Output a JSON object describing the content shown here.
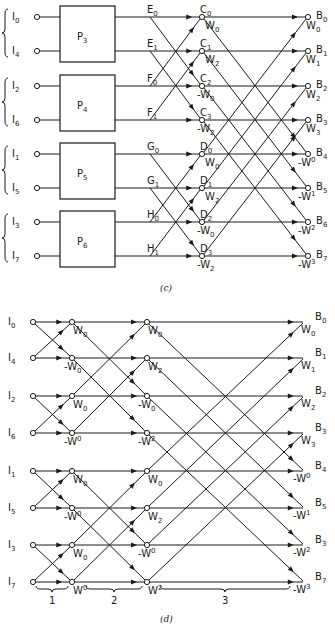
{
  "figure_c": {
    "caption": "(c)",
    "rows_y": [
      17,
      51,
      86,
      120,
      154,
      188,
      222,
      256
    ],
    "inputs": [
      {
        "name": "I",
        "sub": "0"
      },
      {
        "name": "I",
        "sub": "4"
      },
      {
        "name": "I",
        "sub": "2"
      },
      {
        "name": "I",
        "sub": "6"
      },
      {
        "name": "I",
        "sub": "1"
      },
      {
        "name": "I",
        "sub": "5"
      },
      {
        "name": "I",
        "sub": "3"
      },
      {
        "name": "I",
        "sub": "7"
      }
    ],
    "boxes": [
      {
        "name": "P",
        "sub": "3"
      },
      {
        "name": "P",
        "sub": "4"
      },
      {
        "name": "P",
        "sub": "5"
      },
      {
        "name": "P",
        "sub": "6"
      }
    ],
    "mid_labels": [
      {
        "name": "E",
        "sub": "0"
      },
      {
        "name": "E",
        "sub": "1"
      },
      {
        "name": "F",
        "sub": "0"
      },
      {
        "name": "F",
        "sub": "1"
      },
      {
        "name": "G",
        "sub": "0"
      },
      {
        "name": "G",
        "sub": "1"
      },
      {
        "name": "H",
        "sub": "0"
      },
      {
        "name": "H",
        "sub": "1"
      }
    ],
    "stage_nodes": [
      {
        "name": "C",
        "sub": "0",
        "weight": "W",
        "wsub": "0",
        "neg": false
      },
      {
        "name": "C",
        "sub": "1",
        "weight": "W",
        "wsub": "2",
        "neg": false
      },
      {
        "name": "C",
        "sub": "2",
        "weight": "W",
        "wsub": "0",
        "neg": true
      },
      {
        "name": "C",
        "sub": "3",
        "weight": "W",
        "wsub": "2",
        "neg": true
      },
      {
        "name": "D",
        "sub": "0",
        "weight": "W",
        "wsub": "0",
        "neg": false
      },
      {
        "name": "D",
        "sub": "1",
        "weight": "W",
        "wsub": "2",
        "neg": false
      },
      {
        "name": "D",
        "sub": "2",
        "weight": "W",
        "wsub": "0",
        "neg": true
      },
      {
        "name": "D",
        "sub": "3",
        "weight": "W",
        "wsub": "2",
        "neg": true
      }
    ],
    "outputs": [
      {
        "name": "B",
        "sub": "0",
        "weight": "W",
        "wsub": "0",
        "neg": false
      },
      {
        "name": "B",
        "sub": "1",
        "weight": "W",
        "wsub": "1",
        "neg": false
      },
      {
        "name": "B",
        "sub": "2",
        "weight": "W",
        "wsub": "2",
        "neg": false
      },
      {
        "name": "B",
        "sub": "3",
        "weight": "W",
        "wsub": "3",
        "neg": false
      },
      {
        "name": "B",
        "sub": "4",
        "weight": "W",
        "wsub": "0",
        "neg": true
      },
      {
        "name": "B",
        "sub": "5",
        "weight": "W",
        "wsub": "1",
        "neg": true
      },
      {
        "name": "B",
        "sub": "6",
        "weight": "W",
        "wsub": "2",
        "neg": true
      },
      {
        "name": "B",
        "sub": "7",
        "weight": "W",
        "wsub": "3",
        "neg": true
      }
    ]
  },
  "figure_d": {
    "caption": "(d)",
    "rows_y": [
      322,
      358,
      396,
      433,
      471,
      508,
      545,
      582
    ],
    "inputs": [
      {
        "name": "I",
        "sub": "0"
      },
      {
        "name": "I",
        "sub": "4"
      },
      {
        "name": "I",
        "sub": "2"
      },
      {
        "name": "I",
        "sub": "6"
      },
      {
        "name": "I",
        "sub": "1"
      },
      {
        "name": "I",
        "sub": "5"
      },
      {
        "name": "I",
        "sub": "3"
      },
      {
        "name": "I",
        "sub": "7"
      }
    ],
    "stage1_weights": [
      {
        "text": "W",
        "sup": "0",
        "neg": false,
        "style": "sub"
      },
      {
        "text": "W",
        "sup": "0",
        "neg": true,
        "style": "sub"
      },
      {
        "text": "W",
        "sup": "0",
        "neg": false,
        "style": "sub"
      },
      {
        "text": "W",
        "sup": "0",
        "neg": true,
        "style": "sup"
      },
      {
        "text": "W",
        "sup": "0",
        "neg": false,
        "style": "sub"
      },
      {
        "text": "W",
        "sup": "0",
        "neg": true,
        "style": "sup"
      },
      {
        "text": "W",
        "sup": "0",
        "neg": false,
        "style": "sub"
      },
      {
        "text": "W",
        "sup": "0",
        "neg": false,
        "style": "sup"
      }
    ],
    "stage2_weights": [
      {
        "text": "W",
        "sup": "0",
        "neg": false,
        "style": "sub"
      },
      {
        "text": "W",
        "sup": "2",
        "neg": false,
        "style": "sub"
      },
      {
        "text": "W",
        "sup": "0",
        "neg": true,
        "style": "sub"
      },
      {
        "text": "W",
        "sup": "2",
        "neg": true,
        "style": "sup"
      },
      {
        "text": "W",
        "sup": "0",
        "neg": false,
        "style": "sub"
      },
      {
        "text": "W",
        "sup": "2",
        "neg": false,
        "style": "sub"
      },
      {
        "text": "W",
        "sup": "0",
        "neg": true,
        "style": "sup"
      },
      {
        "text": "W",
        "sup": "2",
        "neg": false,
        "style": "sup"
      }
    ],
    "outputs": [
      {
        "name": "B",
        "sub": "0",
        "weight": "W",
        "wsub": "0",
        "neg": false,
        "style": "sub"
      },
      {
        "name": "B",
        "sub": "1",
        "weight": "W",
        "wsub": "1",
        "neg": false,
        "style": "sub"
      },
      {
        "name": "B",
        "sub": "2",
        "weight": "W",
        "wsub": "2",
        "neg": false,
        "style": "sub"
      },
      {
        "name": "B",
        "sub": "3",
        "weight": "W",
        "wsub": "3",
        "neg": false,
        "style": "sub"
      },
      {
        "name": "B",
        "sub": "4",
        "weight": "W",
        "wsub": "0",
        "neg": true,
        "style": "sup"
      },
      {
        "name": "B",
        "sub": "5",
        "weight": "W",
        "wsub": "1",
        "neg": true,
        "style": "sup"
      },
      {
        "name": "B",
        "sub": "3",
        "weight": "W",
        "wsub": "2",
        "neg": true,
        "style": "sup"
      },
      {
        "name": "B",
        "sub": "7",
        "weight": "W",
        "wsub": "3",
        "neg": true,
        "style": "sup"
      }
    ],
    "stage_labels": [
      "1",
      "2",
      "3"
    ]
  }
}
